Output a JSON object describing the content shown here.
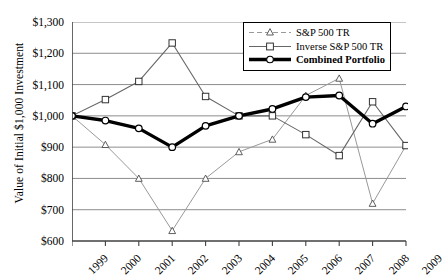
{
  "chart_data": {
    "type": "line",
    "title": "",
    "xlabel": "",
    "ylabel": "Value of Initial $1,000 Investment",
    "categories": [
      "1999",
      "2000",
      "2001",
      "2002",
      "2003",
      "2004",
      "2005",
      "2006",
      "2007",
      "2008",
      "2009"
    ],
    "ylim": [
      600,
      1300
    ],
    "ytick_values": [
      600,
      700,
      800,
      900,
      1000,
      1100,
      1200,
      1300
    ],
    "ytick_labels": [
      "$600",
      "$700",
      "$800",
      "$900",
      "$1,000",
      "$1,100",
      "$1,200",
      "$1,300"
    ],
    "grid": true,
    "legend_position": "top-right",
    "series": [
      {
        "name": "S&P 500 TR",
        "marker": "triangle",
        "color": "#999999",
        "values": [
          1000,
          908,
          800,
          633,
          800,
          885,
          925,
          1065,
          1120,
          720,
          905
        ]
      },
      {
        "name": "Inverse S&P 500 TR",
        "marker": "square",
        "color": "#666666",
        "values": [
          1000,
          1052,
          1110,
          1233,
          1062,
          1000,
          1000,
          940,
          873,
          1045,
          905
        ]
      },
      {
        "name": "Combined Portfolio",
        "marker": "circle",
        "color": "#000000",
        "values": [
          1000,
          985,
          960,
          900,
          968,
          1000,
          1022,
          1060,
          1065,
          975,
          1030
        ]
      }
    ]
  },
  "legend": {
    "items": [
      {
        "label": "S&P 500 TR"
      },
      {
        "label": "Inverse S&P 500 TR"
      },
      {
        "label": "Combined Portfolio"
      }
    ]
  }
}
